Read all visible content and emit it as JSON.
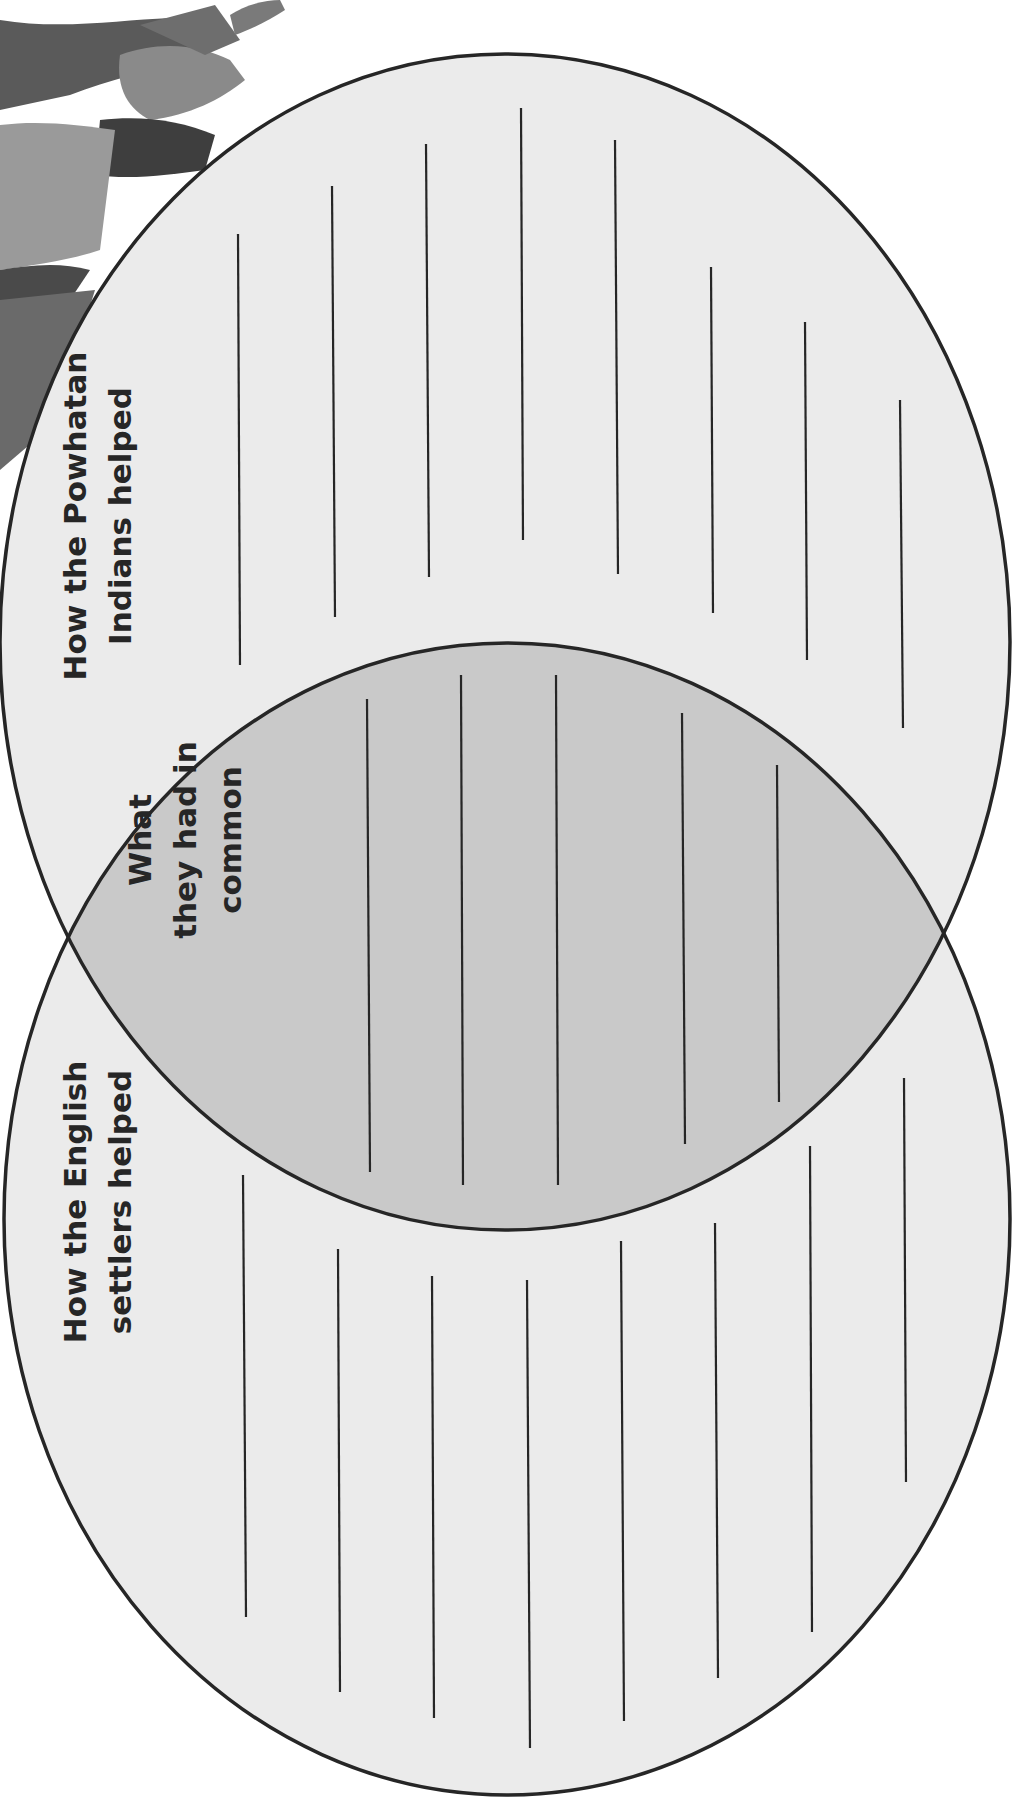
{
  "diagram": {
    "type": "venn",
    "orientation": "rotated-90-ccw",
    "sets": [
      {
        "id": "powhatan",
        "title_lines": [
          "How the Powhatan",
          "Indians helped"
        ],
        "fill": "#ebebeb",
        "writing_lines": 8
      },
      {
        "id": "english",
        "title_lines": [
          "How the English",
          "settlers helped"
        ],
        "fill": "#ebebeb",
        "writing_lines": 8
      }
    ],
    "intersection": {
      "title_lines": [
        "What",
        "they had in",
        "common"
      ],
      "fill": "#c9c9c9",
      "writing_lines": 5
    },
    "outline_color": "#262626",
    "line_color": "#262626"
  },
  "decorative_image": {
    "description": "grayscale illustration fragment of figures in cloaks, partially cropped at top-left corner"
  }
}
